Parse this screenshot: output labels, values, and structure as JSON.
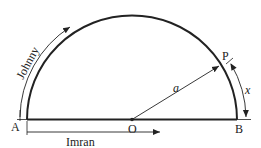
{
  "diagram": {
    "points": {
      "A": "A",
      "O": "O",
      "B": "B",
      "P": "P"
    },
    "radius_label": "a",
    "arc_label": "x",
    "path_labels": {
      "johnny": "Johnny",
      "imran": "Imran"
    },
    "colors": {
      "stroke": "#222222",
      "background": "#ffffff"
    }
  }
}
